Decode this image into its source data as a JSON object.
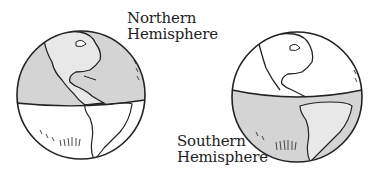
{
  "figure": {
    "labels": {
      "northern": {
        "line1": "Northern",
        "line2": "Hemisphere"
      },
      "southern": {
        "line1": "Southern",
        "line2": "Hemisphere"
      }
    },
    "globes": [
      {
        "name": "globe-northern-shaded",
        "shaded_half": "north",
        "center": [
          81,
          95
        ],
        "radius": 64
      },
      {
        "name": "globe-southern-shaded",
        "shaded_half": "south",
        "center": [
          297,
          97
        ],
        "radius": 65
      }
    ],
    "colors": {
      "shade": "#d4d4d4",
      "land_shade": "#e6e6e6",
      "outline": "#222222",
      "background": "#ffffff"
    }
  }
}
